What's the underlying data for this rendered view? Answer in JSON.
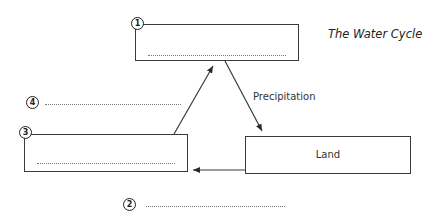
{
  "diagram": {
    "title": "The Water Cycle",
    "boxes": [
      {
        "id": "1",
        "number": "1",
        "label": ""
      },
      {
        "id": "3",
        "number": "3",
        "label": ""
      },
      {
        "id": "land",
        "number": "",
        "label": "Land"
      }
    ],
    "blanks": [
      {
        "number": "2",
        "value": ""
      },
      {
        "number": "4",
        "value": ""
      }
    ],
    "arrows": [
      {
        "from": "3",
        "to": "1",
        "label": "4"
      },
      {
        "from": "1",
        "to": "land",
        "label": "Precipitation"
      },
      {
        "from": "land",
        "to": "3",
        "label": "2"
      }
    ],
    "arrow_labels": {
      "precipitation": "Precipitation"
    },
    "colors": {
      "line": "#3a3a3a",
      "text": "#222222",
      "background": "#ffffff"
    }
  }
}
